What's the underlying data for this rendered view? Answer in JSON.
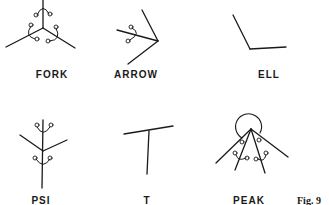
{
  "figure": {
    "caption": "Fig. 9",
    "junctions": [
      {
        "id": "fork",
        "label": "FORK"
      },
      {
        "id": "arrow",
        "label": "ARROW"
      },
      {
        "id": "ell",
        "label": "ELL"
      },
      {
        "id": "psi",
        "label": "PSI"
      },
      {
        "id": "t",
        "label": "T"
      },
      {
        "id": "peak",
        "label": "PEAK"
      }
    ]
  },
  "colors": {
    "ink": "#1a1a1a",
    "background": "#ffffff"
  }
}
